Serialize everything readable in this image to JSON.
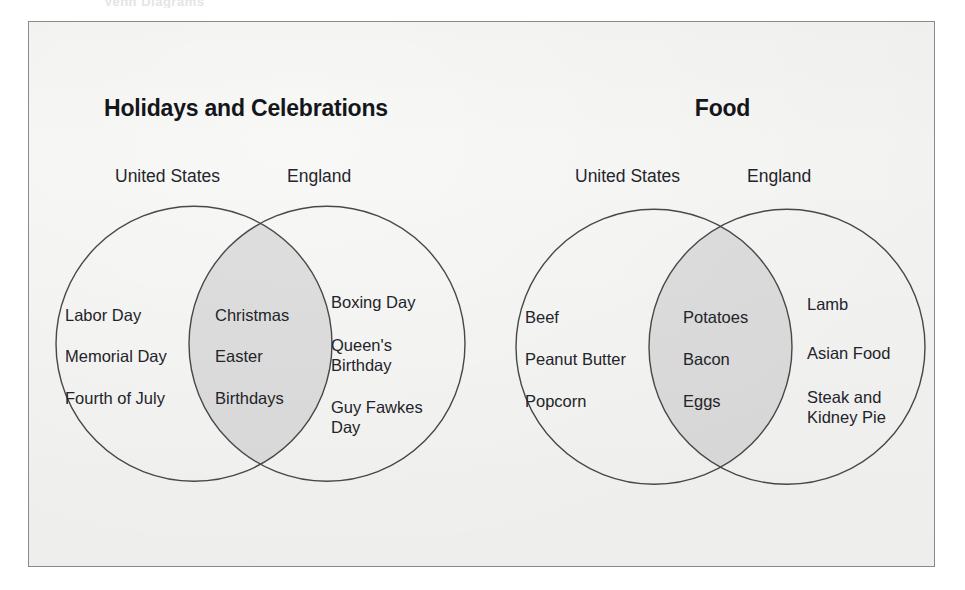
{
  "top_caption": "Venn Diagrams",
  "panel": {
    "background_color": "#fbfbfa",
    "border_color": "#8a8a8a"
  },
  "colors": {
    "circle_stroke": "#4a4a4a",
    "overlap_fill": "#e2e2e2",
    "circle_fill": "#ffffff",
    "text": "#24252a",
    "title_text": "#15161a"
  },
  "diagrams": [
    {
      "id": "holidays",
      "title": "Holidays and Celebrations",
      "left_set_label": "United States",
      "right_set_label": "England",
      "left_only": [
        "Labor Day",
        "Memorial Day",
        "Fourth of July"
      ],
      "intersection": [
        "Christmas",
        "Easter",
        "Birthdays"
      ],
      "right_only": [
        "Boxing Day",
        "Queen's\nBirthday",
        "Guy Fawkes\nDay"
      ]
    },
    {
      "id": "food",
      "title": "Food",
      "left_set_label": "United States",
      "right_set_label": "England",
      "left_only": [
        "Beef",
        "Peanut Butter",
        "Popcorn"
      ],
      "intersection": [
        "Potatoes",
        "Bacon",
        "Eggs"
      ],
      "right_only": [
        "Lamb",
        "Asian Food",
        "Steak and\nKidney Pie"
      ]
    }
  ]
}
